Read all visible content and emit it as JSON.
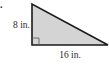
{
  "problem": {
    "number_fragment": "."
  },
  "triangle": {
    "type": "right-triangle",
    "height_label": "8 in.",
    "base_label": "16 in.",
    "height_value": 8,
    "base_value": 16,
    "unit": "in.",
    "fill_color": "#d4d4d4",
    "stroke_color": "#1a1a1a"
  }
}
